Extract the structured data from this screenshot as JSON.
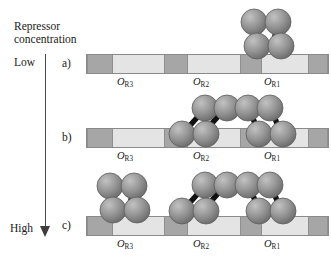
{
  "figure": {
    "axis_title": "Repressor\nconcentration",
    "axis_low_label": "Low",
    "axis_high_label": "High",
    "axis_direction": "downward-arrow",
    "operator_labels": [
      "O",
      "O",
      "O"
    ],
    "operator_subscripts": [
      "R3",
      "R2",
      "R1"
    ],
    "colors": {
      "dna_operator_segment": "#e4e4e4",
      "dna_spacer_segment": "#a6a6a6",
      "dna_outline": "#8a8a8a",
      "protein_sphere": "#8e8e8e",
      "protein_linker": "#111111",
      "axis": "#4a4a4a",
      "text": "#1a1a1a"
    },
    "rows": [
      {
        "label": "a)",
        "occupancy_note": "Low",
        "bound_operators": [
          "OR1"
        ],
        "dimer_count": 1
      },
      {
        "label": "b)",
        "occupancy_note": "Intermediate",
        "bound_operators": [
          "OR2",
          "OR1"
        ],
        "dimer_count": 2
      },
      {
        "label": "c)",
        "occupancy_note": "High",
        "bound_operators": [
          "OR3",
          "OR2",
          "OR1"
        ],
        "dimer_count": 3
      }
    ]
  }
}
